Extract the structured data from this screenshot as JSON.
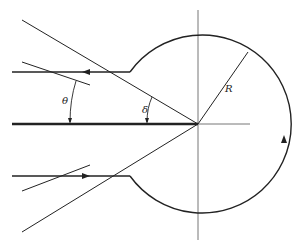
{
  "diagram": {
    "type": "contour-geometry",
    "labels": {
      "theta": "θ",
      "delta": "δ",
      "radius": "R"
    },
    "colors": {
      "stroke": "#222222",
      "axis": "#777777",
      "background": "#ffffff"
    },
    "geometry": {
      "center": [
        198,
        124
      ],
      "radius": 89
    }
  }
}
